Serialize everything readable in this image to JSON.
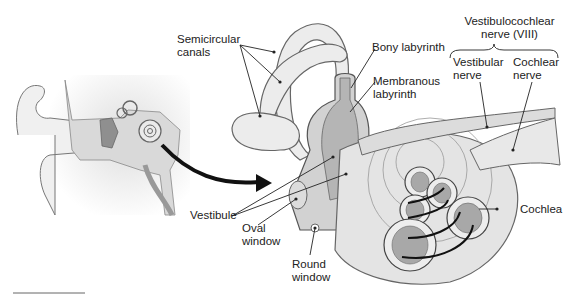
{
  "diagram": {
    "labels": {
      "semicircular_canals": [
        "Semicircular",
        "canals"
      ],
      "bony_labyrinth": "Bony labyrinth",
      "membranous_labyrinth": [
        "Membranous",
        "labyrinth"
      ],
      "vestibulocochlear_nerve": [
        "Vestibulocochlear",
        "nerve (VIII)"
      ],
      "vestibular_nerve": [
        "Vestibular",
        "nerve"
      ],
      "cochlear_nerve": [
        "Cochlear",
        "nerve"
      ],
      "vestibule": "Vestibule",
      "oval_window": [
        "Oval",
        "window"
      ],
      "round_window": [
        "Round",
        "window"
      ],
      "cochlea": "Cochlea"
    },
    "colors": {
      "outline": "#555555",
      "bone_fill": "#e6e6e6",
      "membrane_fill": "#bdbdbd",
      "dark_fill": "#9a9a9a",
      "leader": "#222222",
      "arrow": "#111111"
    }
  }
}
